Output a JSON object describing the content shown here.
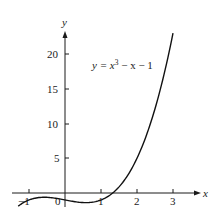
{
  "chart_data": {
    "type": "line",
    "title": "",
    "xlabel": "x",
    "ylabel": "y",
    "xlim": [
      -1.3,
      3.5
    ],
    "ylim": [
      -2,
      24
    ],
    "grid": false,
    "legend": null,
    "x_ticks": [
      -1,
      0,
      1,
      2,
      3
    ],
    "x_tick_labels": [
      "-1",
      "0",
      "1",
      "2",
      "3"
    ],
    "y_ticks": [
      5,
      10,
      15,
      20
    ],
    "y_tick_labels": [
      "5",
      "10",
      "15",
      "20"
    ],
    "annotations": [
      {
        "text_parts": [
          "y = x",
          "3",
          " − x − 1"
        ],
        "x": 0.75,
        "y": 18
      }
    ],
    "series": [
      {
        "name": "y = x^3 - x - 1",
        "function": "x^3 - x - 1",
        "x": [
          -1.3,
          -1.0,
          -0.5,
          0,
          0.5,
          0.577,
          1.0,
          1.3247,
          1.5,
          2.0,
          2.5,
          3.0
        ],
        "values": [
          -1.897,
          -1.0,
          -0.625,
          -1.0,
          -1.375,
          -1.385,
          -1.0,
          0.0,
          0.875,
          5.0,
          12.125,
          23.0
        ]
      }
    ]
  },
  "labels": {
    "x_axis": "x",
    "y_axis": "y",
    "equation_main": "y = x",
    "equation_exp": "3",
    "equation_rest": " − x − 1",
    "xtick_m1": "−1",
    "xtick_0": "0",
    "xtick_1": "1",
    "xtick_2": "2",
    "xtick_3": "3",
    "ytick_5": "5",
    "ytick_10": "10",
    "ytick_15": "15",
    "ytick_20": "20"
  }
}
